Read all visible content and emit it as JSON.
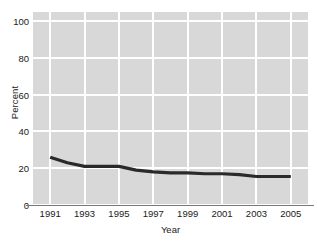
{
  "chart_data": {
    "type": "line",
    "title": "",
    "xlabel": "Year",
    "ylabel": "Percent",
    "x": [
      1991,
      1992,
      1993,
      1994,
      1995,
      1996,
      1997,
      1998,
      1999,
      2000,
      2001,
      2002,
      2003,
      2004,
      2005
    ],
    "values": [
      26,
      23,
      21,
      21,
      21,
      19,
      18,
      17.5,
      17.5,
      17,
      17,
      16.5,
      15.5,
      15.5,
      15.5
    ],
    "series": [
      {
        "name": "Percent",
        "values": [
          26,
          23,
          21,
          21,
          21,
          19,
          18,
          17.5,
          17.5,
          17,
          17,
          16.5,
          15.5,
          15.5,
          15.5
        ]
      }
    ],
    "categories": [
      "1991",
      "1992",
      "1993",
      "1994",
      "1995",
      "1996",
      "1997",
      "1998",
      "1999",
      "2000",
      "2001",
      "2002",
      "2003",
      "2004",
      "2005"
    ],
    "xlim": [
      1990,
      2006
    ],
    "ylim": [
      0,
      105
    ],
    "ytick_labels": [
      "0",
      "20",
      "40",
      "60",
      "80",
      "100"
    ],
    "ytick_values": [
      0,
      20,
      40,
      60,
      80,
      100
    ],
    "xtick_labels": [
      "1991",
      "1993",
      "1995",
      "1997",
      "1999",
      "2001",
      "2003",
      "2005"
    ],
    "xtick_values": [
      1991,
      1993,
      1995,
      1997,
      1999,
      2001,
      2003,
      2005
    ],
    "grid": true,
    "legend": "none",
    "colors": {
      "plot_background": "#d8d8d8",
      "gridline": "#ffffff",
      "line": "#2a2a2a",
      "axis": "#777777",
      "text": "#1a1a1a",
      "page_background": "#ffffff"
    },
    "line_width": 3.2,
    "annotations": []
  }
}
